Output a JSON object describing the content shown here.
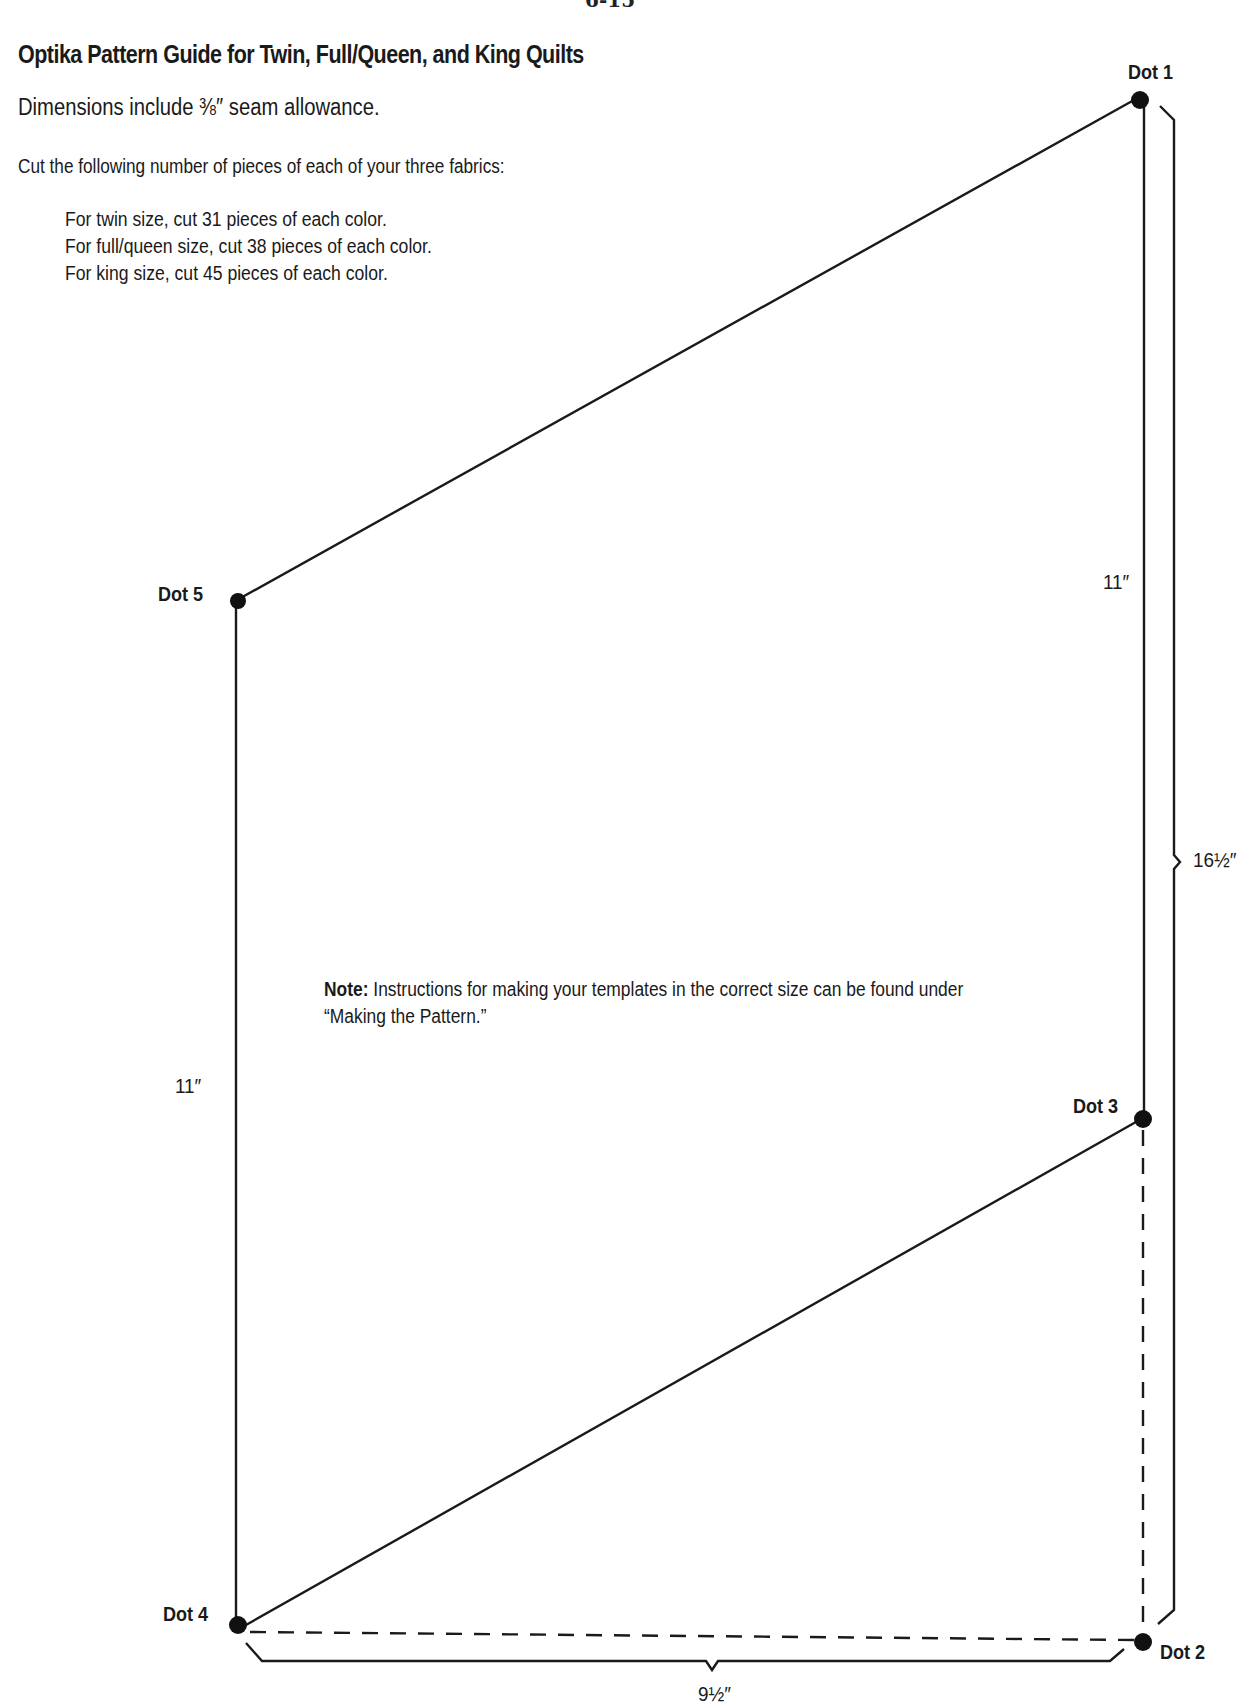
{
  "page": {
    "page_number": "6-15",
    "title": "Optika Pattern Guide for Twin, Full/Queen, and King Quilts",
    "dimensions_note": "Dimensions include ⅜″ seam allowance.",
    "cut_instruction": "Cut the following number of pieces of each of your three fabrics:",
    "sizes": [
      {
        "text": "For twin size, cut 31 pieces of each color."
      },
      {
        "text": "For full/queen size, cut 38 pieces of each color."
      },
      {
        "text": "For king size, cut 45 pieces of each color."
      }
    ],
    "note": {
      "label": "Note:",
      "text": " Instructions for making your templates in the correct size can be found under",
      "text_line2": "“Making the Pattern.”"
    }
  },
  "diagram": {
    "dots": [
      {
        "label": "Dot 1"
      },
      {
        "label": "Dot 2"
      },
      {
        "label": "Dot 3"
      },
      {
        "label": "Dot 4"
      },
      {
        "label": "Dot 5"
      }
    ],
    "measurements": {
      "right_edge": "11″",
      "left_edge": "11″",
      "total_height": "16½″",
      "width": "9½″"
    },
    "line_color": "#1a1a1a"
  }
}
